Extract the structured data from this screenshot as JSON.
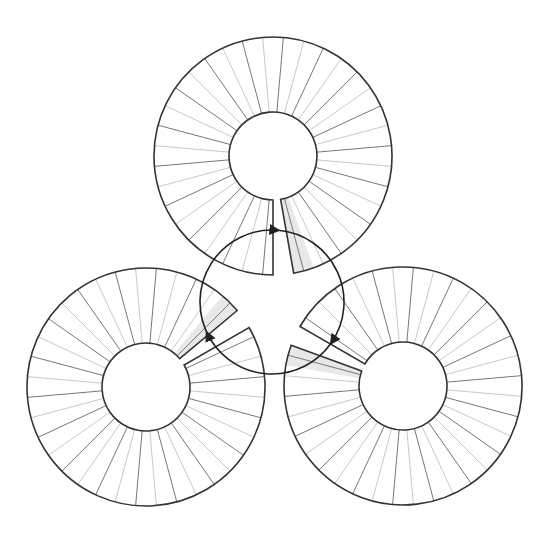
{
  "diagram": {
    "title": "",
    "canvas": {
      "width": 551,
      "height": 541,
      "background": "#ffffff"
    },
    "colors": {
      "outline": "#333333",
      "spoke_dark": "#777777",
      "spoke_light": "#c8c8c8",
      "shade": "#e8e8e8",
      "arrow": "#222222"
    },
    "ring_geometry": {
      "outer_radius": 119,
      "inner_radius": 44,
      "spoke_step_deg": 10,
      "gap_deg": 10,
      "shade_deg": 10
    },
    "rings": [
      {
        "id": "top",
        "cx": 273,
        "cy": 156,
        "facing_deg": 90
      },
      {
        "id": "bottom-left",
        "cx": 146,
        "cy": 387,
        "facing_deg": -30
      },
      {
        "id": "bottom-right",
        "cx": 403,
        "cy": 386,
        "facing_deg": 210
      }
    ],
    "cycle": {
      "cx": 272,
      "cy": 302,
      "r": 72,
      "arrow_count": 3,
      "direction": "clockwise"
    }
  }
}
